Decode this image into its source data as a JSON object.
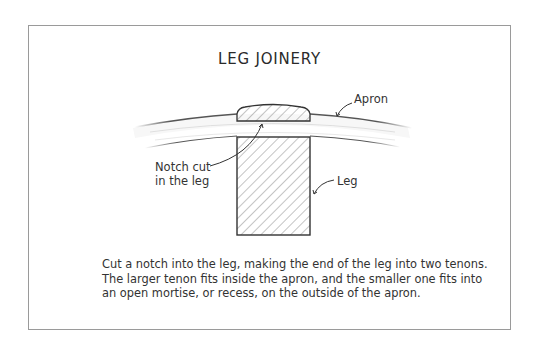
{
  "figure": {
    "title": "LEG JOINERY",
    "labels": {
      "apron": "Apron",
      "notch_line1": "Notch cut",
      "notch_line2": "in the leg",
      "leg": "Leg"
    },
    "caption": {
      "lines": [
        "Cut a notch into the leg, making the end of the leg into two tenons.",
        "The larger tenon fits inside the apron, and the smaller one fits into",
        "an open mortise, or recess, on the outside of the apron."
      ]
    },
    "colors": {
      "frame_border": "#9a9a9a",
      "ink": "#333333",
      "hatch": "#888888"
    }
  }
}
